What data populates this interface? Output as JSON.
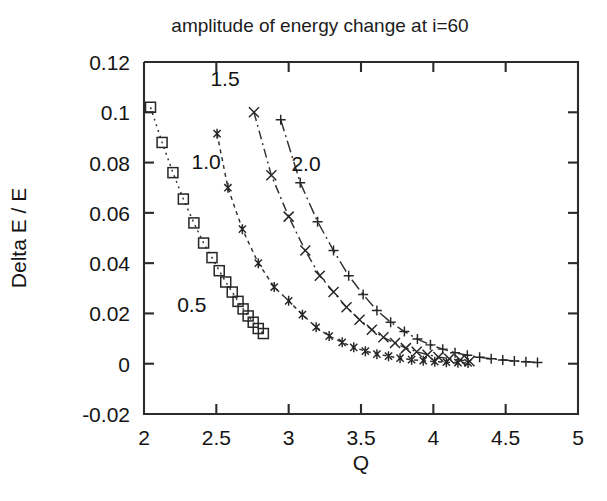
{
  "figure": {
    "title": "amplitude of energy change at i=60",
    "background_color": "#ffffff",
    "line_color": "#303030"
  },
  "chart_data": {
    "type": "scatter",
    "title": "amplitude of energy change at i=60",
    "xlabel": "Q",
    "ylabel": "Delta E / E",
    "xlim": [
      2,
      5
    ],
    "ylim": [
      -0.02,
      0.12
    ],
    "xticks": [
      2,
      2.5,
      3,
      3.5,
      4,
      4.5,
      5
    ],
    "xtick_labels": [
      "2",
      "2.5",
      "3",
      "3.5",
      "4",
      "4.5",
      "5"
    ],
    "yticks": [
      -0.02,
      0,
      0.02,
      0.04,
      0.06,
      0.08,
      0.1,
      0.12
    ],
    "ytick_labels": [
      "-0.02",
      "0",
      "0.02",
      "0.04",
      "0.06",
      "0.08",
      "0.1",
      "0.12"
    ],
    "grid": false,
    "legend": "inline-curve-labels",
    "annotations": [
      {
        "text": "0.5",
        "x": 2.33,
        "y": 0.0205
      },
      {
        "text": "1.0",
        "x": 2.43,
        "y": 0.0775
      },
      {
        "text": "1.5",
        "x": 2.56,
        "y": 0.1105
      },
      {
        "text": "2.0",
        "x": 3.12,
        "y": 0.0765
      }
    ],
    "series": [
      {
        "name": "0.5",
        "marker": "square",
        "linestyle": "dotted",
        "points": [
          [
            2.045,
            0.102
          ],
          [
            2.125,
            0.088
          ],
          [
            2.2,
            0.076
          ],
          [
            2.272,
            0.0655
          ],
          [
            2.345,
            0.056
          ],
          [
            2.412,
            0.048
          ],
          [
            2.47,
            0.0422
          ],
          [
            2.52,
            0.037
          ],
          [
            2.565,
            0.0325
          ],
          [
            2.61,
            0.0285
          ],
          [
            2.65,
            0.0248
          ],
          [
            2.685,
            0.0218
          ],
          [
            2.72,
            0.019
          ],
          [
            2.755,
            0.0165
          ],
          [
            2.79,
            0.014
          ],
          [
            2.825,
            0.012
          ]
        ]
      },
      {
        "name": "1.0",
        "marker": "asterisk",
        "linestyle": "dashed-fine",
        "points": [
          [
            2.505,
            0.0915
          ],
          [
            2.58,
            0.07
          ],
          [
            2.68,
            0.0535
          ],
          [
            2.79,
            0.04
          ],
          [
            2.9,
            0.0305
          ],
          [
            3.0,
            0.025
          ],
          [
            3.095,
            0.0195
          ],
          [
            3.19,
            0.0145
          ],
          [
            3.28,
            0.011
          ],
          [
            3.37,
            0.0085
          ],
          [
            3.45,
            0.0065
          ],
          [
            3.53,
            0.005
          ],
          [
            3.61,
            0.0038
          ],
          [
            3.69,
            0.003
          ],
          [
            3.77,
            0.0022
          ],
          [
            3.85,
            0.0016
          ],
          [
            3.93,
            0.0012
          ],
          [
            4.01,
            0.0008
          ],
          [
            4.09,
            0.0006
          ],
          [
            4.17,
            0.0004
          ],
          [
            4.24,
            0.0003
          ]
        ]
      },
      {
        "name": "1.5",
        "marker": "cross",
        "linestyle": "dashdot",
        "points": [
          [
            2.76,
            0.1
          ],
          [
            2.88,
            0.075
          ],
          [
            3.0,
            0.0585
          ],
          [
            3.115,
            0.045
          ],
          [
            3.215,
            0.035
          ],
          [
            3.31,
            0.0285
          ],
          [
            3.4,
            0.0225
          ],
          [
            3.49,
            0.0175
          ],
          [
            3.575,
            0.0135
          ],
          [
            3.655,
            0.0105
          ],
          [
            3.735,
            0.0082
          ],
          [
            3.81,
            0.0062
          ],
          [
            3.885,
            0.0048
          ],
          [
            3.96,
            0.0036
          ],
          [
            4.035,
            0.0027
          ],
          [
            4.11,
            0.002
          ],
          [
            4.185,
            0.0015
          ],
          [
            4.25,
            0.001
          ]
        ]
      },
      {
        "name": "2.0",
        "marker": "plus",
        "linestyle": "dashdot-long",
        "points": [
          [
            2.945,
            0.097
          ],
          [
            3.08,
            0.072
          ],
          [
            3.2,
            0.0565
          ],
          [
            3.31,
            0.045
          ],
          [
            3.415,
            0.035
          ],
          [
            3.515,
            0.0275
          ],
          [
            3.61,
            0.0212
          ],
          [
            3.705,
            0.0165
          ],
          [
            3.8,
            0.0128
          ],
          [
            3.89,
            0.0098
          ],
          [
            3.98,
            0.0075
          ],
          [
            4.065,
            0.0058
          ],
          [
            4.15,
            0.0044
          ],
          [
            4.235,
            0.0034
          ],
          [
            4.32,
            0.0026
          ],
          [
            4.4,
            0.002
          ],
          [
            4.48,
            0.0015
          ],
          [
            4.56,
            0.0011
          ],
          [
            4.64,
            0.0008
          ],
          [
            4.72,
            0.0005
          ]
        ]
      }
    ]
  }
}
